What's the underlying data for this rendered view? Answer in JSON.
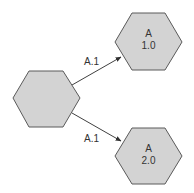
{
  "diagram": {
    "colors": {
      "node_fill": "#d3d3d3",
      "node_stroke": "#5a5a5a",
      "edge": "#404040",
      "text": "#333333"
    },
    "nodes": [
      {
        "id": "root",
        "shape": "hexagon",
        "label_line1": "",
        "label_line2": ""
      },
      {
        "id": "a1",
        "shape": "hexagon",
        "label_line1": "A",
        "label_line2": "1.0"
      },
      {
        "id": "a2",
        "shape": "hexagon",
        "label_line1": "A",
        "label_line2": "2.0"
      }
    ],
    "edges": [
      {
        "from": "root",
        "to": "a1",
        "label": "A.1"
      },
      {
        "from": "root",
        "to": "a2",
        "label": "A.1"
      }
    ]
  }
}
